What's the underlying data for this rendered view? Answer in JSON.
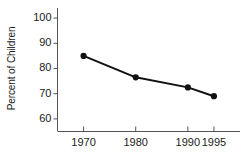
{
  "chart_data": {
    "type": "line",
    "title": "",
    "subtitle": "",
    "xlabel": "",
    "ylabel": "Percent of Children",
    "x": [
      1970,
      1980,
      1990,
      1995
    ],
    "categories": [
      "1970",
      "1980",
      "1990",
      "1995"
    ],
    "values": [
      85,
      76.5,
      72.5,
      69
    ],
    "series": [
      {
        "name": "Percent of Children",
        "values": [
          85,
          76.5,
          72.5,
          69
        ]
      }
    ],
    "ylim": [
      55,
      104
    ],
    "xlim": [
      1965,
      2000
    ],
    "y_ticks": [
      60,
      70,
      80,
      90,
      100
    ],
    "y_tick_labels": [
      "60",
      "70",
      "80",
      "90",
      "100"
    ],
    "x_ticks": [
      1970,
      1980,
      1990,
      1995
    ],
    "x_tick_labels": [
      "1970",
      "1980",
      "1990",
      "1995"
    ],
    "grid": false,
    "legend": false,
    "legend_position": "none",
    "annotations": [],
    "colors": {
      "line": "#111111",
      "marker": "#111111",
      "axis": "#555555",
      "background": "#ffffff",
      "text": "#1a1a1a"
    },
    "marker": "circle",
    "marker_size": 5,
    "line_width": 2
  }
}
